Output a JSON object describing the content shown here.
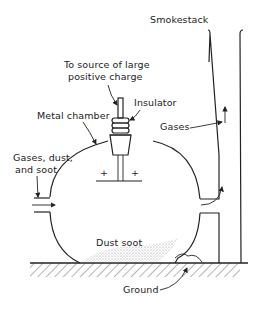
{
  "diagram": {
    "labels": {
      "smokestack": "Smokestack",
      "charge_source_line1": "To source of large",
      "charge_source_line2": "positive charge",
      "insulator": "Insulator",
      "metal_chamber": "Metal chamber",
      "gases_out": "Gases",
      "gases_in_line1": "Gases, dust,",
      "gases_in_line2": "and soot",
      "plus_left": "+",
      "plus_right": "+",
      "dust_soot": "Dust soot",
      "ground": "Ground"
    },
    "colors": {
      "line": "#222222",
      "background": "#ffffff",
      "dust": "#bbbbbb"
    }
  }
}
